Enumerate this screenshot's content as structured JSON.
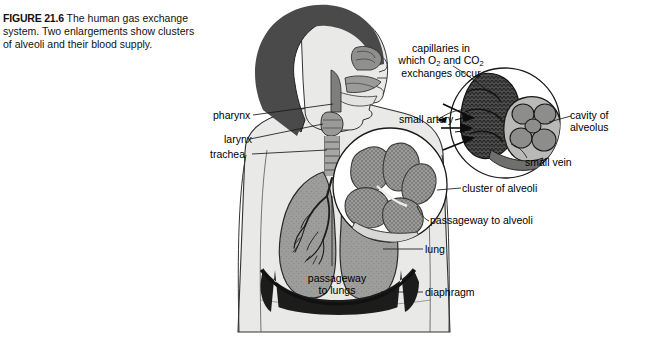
{
  "caption": {
    "figure_number": "FIGURE 21.6",
    "text": "The human gas exchange system. Two enlargements show clusters of alveoli and their blood supply."
  },
  "labels": {
    "pharynx": "pharynx",
    "larynx": "larynx",
    "trachea": "trachea",
    "capillaries_line1": "capillaries in",
    "capillaries_line2_a": "which O",
    "capillaries_line2_sub1": "2",
    "capillaries_line2_b": " and CO",
    "capillaries_line2_sub2": "2",
    "capillaries_line3": "exchanges occur",
    "small_artery": "small artery",
    "small_vein": "small vein",
    "cavity_of_alveolus": "cavity of alveolus",
    "cluster_of_alveoli": "cluster of alveoli",
    "passageway_to_alveoli": "passageway to alveoli",
    "lung": "lung",
    "diaphragm": "diaphragm",
    "passageway_to_lungs_line1": "passageway",
    "passageway_to_lungs_line2": "to lungs"
  },
  "colors": {
    "background": "#ffffff",
    "skin": "#e8e8e6",
    "hair": "#4a4a4a",
    "lung": "#9a9a98",
    "diaphragm": "#1c1c1c",
    "alveoli_light": "#8d8d8b",
    "alveoli_dark": "#3d3d3d",
    "outline": "#1a1a1a",
    "text": "#111111"
  },
  "figure_meta": {
    "enlargement_count": "2",
    "illustration_type": "anatomical-diagram"
  }
}
